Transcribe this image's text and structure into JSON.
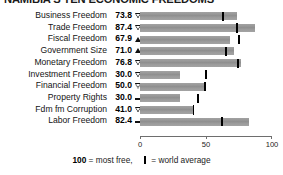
{
  "title": "NAMIBIA'S TEN ECONOMIC FREEDOMS",
  "chart_data": {
    "type": "bar",
    "title": "NAMIBIA'S TEN ECONOMIC FREEDOMS",
    "xlabel": "",
    "ylabel": "",
    "xlim": [
      0,
      100
    ],
    "grid": false,
    "orientation": "horizontal",
    "tick_labels": [
      "0",
      "50",
      "100"
    ],
    "tick_values": [
      0,
      50,
      100
    ],
    "categories": [
      "Business Freedom",
      "Trade Freedom",
      "Fiscal Freedom",
      "Government Size",
      "Monetary Freedom",
      "Investment Freedom",
      "Financial Freedom",
      "Property Rights",
      "Fdm fm Corruption",
      "Labor Freedom"
    ],
    "values": [
      73.8,
      87.4,
      67.9,
      71.0,
      76.8,
      30.0,
      50.0,
      30.0,
      41.0,
      82.4
    ],
    "trends": [
      "down",
      "down",
      "up",
      "up",
      "down",
      "down",
      "down",
      "flat",
      "down",
      "flat"
    ],
    "world_average": [
      63.0,
      73.6,
      74.9,
      65.0,
      74.1,
      50.0,
      49.0,
      43.8,
      40.5,
      62.1
    ],
    "bar_color": "#9b9b9b",
    "average_marker_color": "#000000"
  },
  "rows": [
    {
      "label": "Business Freedom",
      "value": "73.8",
      "trend": "down",
      "bar": 73.8,
      "avg": 63.0
    },
    {
      "label": "Trade Freedom",
      "value": "87.4",
      "trend": "down",
      "bar": 87.4,
      "avg": 73.6
    },
    {
      "label": "Fiscal Freedom",
      "value": "67.9",
      "trend": "up",
      "bar": 67.9,
      "avg": 74.9
    },
    {
      "label": "Government Size",
      "value": "71.0",
      "trend": "up",
      "bar": 71.0,
      "avg": 65.0
    },
    {
      "label": "Monetary Freedom",
      "value": "76.8",
      "trend": "down",
      "bar": 76.8,
      "avg": 74.1
    },
    {
      "label": "Investment Freedom",
      "value": "30.0",
      "trend": "down",
      "bar": 30.0,
      "avg": 50.0
    },
    {
      "label": "Financial Freedom",
      "value": "50.0",
      "trend": "down",
      "bar": 50.0,
      "avg": 49.0
    },
    {
      "label": "Property Rights",
      "value": "30.0",
      "trend": "flat",
      "bar": 30.0,
      "avg": 43.8
    },
    {
      "label": "Fdm fm Corruption",
      "value": "41.0",
      "trend": "down",
      "bar": 41.0,
      "avg": 40.5
    },
    {
      "label": "Labor Freedom",
      "value": "82.4",
      "trend": "flat",
      "bar": 82.4,
      "avg": 62.1
    }
  ],
  "axis": {
    "labels": [
      "0",
      "50",
      "100"
    ],
    "values": [
      0,
      50,
      100
    ]
  },
  "legend": {
    "most_free_value": "100",
    "most_free_text": "= most free,",
    "average_text": "= world average"
  }
}
